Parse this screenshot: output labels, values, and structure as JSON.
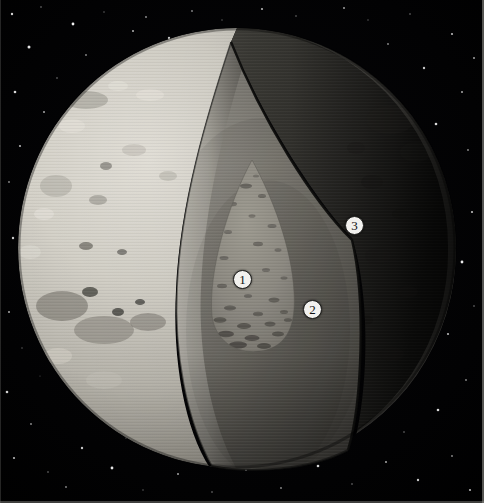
{
  "figure": {
    "background": "starfield",
    "width": 484,
    "height": 503
  },
  "colors": {
    "space": "#010103",
    "star": "#ffffff",
    "surface_light": "#d8d5cd",
    "surface_mid": "#b0ada4",
    "surface_dark": "#4a4843",
    "terminator_shadow": "#1d1c1a",
    "mantle_light": "#9d9a92",
    "mantle_mid": "#77746d",
    "mantle_dark": "#3e3c38",
    "core_fill": "#8d8a82",
    "core_speckle": "#3a3834",
    "core_base_arc": "#0b0b0a",
    "cut_wall_bright": "#c9c6bd",
    "callout_fill": "#f2f1ee",
    "callout_text": "#101010",
    "frame_line": "#9a9a96"
  },
  "callouts": [
    {
      "id": "1",
      "label": "1",
      "region": "core",
      "x": 242,
      "y": 279
    },
    {
      "id": "2",
      "label": "2",
      "region": "mantle",
      "x": 312,
      "y": 309
    },
    {
      "id": "3",
      "label": "3",
      "region": "crust",
      "x": 354,
      "y": 225
    }
  ],
  "geometry": {
    "globe": {
      "cx": 237,
      "cy": 248,
      "rx": 219,
      "ry": 220
    },
    "wedge_apex": {
      "x": 231,
      "y": 42
    },
    "core": {
      "cx": 253,
      "cy": 262,
      "rx": 44,
      "ry": 100
    }
  },
  "stars": [
    {
      "x": 12,
      "y": 14,
      "r": 1.2,
      "o": 0.82
    },
    {
      "x": 41,
      "y": 7,
      "r": 0.8,
      "o": 0.5
    },
    {
      "x": 73,
      "y": 24,
      "r": 1.4,
      "o": 0.95
    },
    {
      "x": 104,
      "y": 12,
      "r": 0.7,
      "o": 0.45
    },
    {
      "x": 133,
      "y": 31,
      "r": 1.0,
      "o": 0.7
    },
    {
      "x": 29,
      "y": 47,
      "r": 1.5,
      "o": 0.9
    },
    {
      "x": 86,
      "y": 55,
      "r": 0.9,
      "o": 0.55
    },
    {
      "x": 118,
      "y": 66,
      "r": 1.1,
      "o": 0.72
    },
    {
      "x": 57,
      "y": 78,
      "r": 0.8,
      "o": 0.5
    },
    {
      "x": 15,
      "y": 92,
      "r": 1.3,
      "o": 0.85
    },
    {
      "x": 97,
      "y": 88,
      "r": 0.7,
      "o": 0.42
    },
    {
      "x": 146,
      "y": 17,
      "r": 0.9,
      "o": 0.6
    },
    {
      "x": 169,
      "y": 38,
      "r": 1.2,
      "o": 0.78
    },
    {
      "x": 44,
      "y": 112,
      "r": 1.0,
      "o": 0.65
    },
    {
      "x": 78,
      "y": 128,
      "r": 0.8,
      "o": 0.48
    },
    {
      "x": 20,
      "y": 146,
      "r": 1.1,
      "o": 0.7
    },
    {
      "x": 9,
      "y": 182,
      "r": 0.9,
      "o": 0.55
    },
    {
      "x": 34,
      "y": 205,
      "r": 0.7,
      "o": 0.4
    },
    {
      "x": 13,
      "y": 238,
      "r": 1.2,
      "o": 0.8
    },
    {
      "x": 28,
      "y": 276,
      "r": 0.8,
      "o": 0.5
    },
    {
      "x": 9,
      "y": 312,
      "r": 1.0,
      "o": 0.66
    },
    {
      "x": 22,
      "y": 348,
      "r": 0.7,
      "o": 0.42
    },
    {
      "x": 7,
      "y": 392,
      "r": 1.3,
      "o": 0.82
    },
    {
      "x": 31,
      "y": 424,
      "r": 0.9,
      "o": 0.58
    },
    {
      "x": 14,
      "y": 458,
      "r": 1.1,
      "o": 0.72
    },
    {
      "x": 48,
      "y": 472,
      "r": 0.8,
      "o": 0.5
    },
    {
      "x": 82,
      "y": 448,
      "r": 1.2,
      "o": 0.78
    },
    {
      "x": 66,
      "y": 487,
      "r": 0.9,
      "o": 0.55
    },
    {
      "x": 112,
      "y": 468,
      "r": 1.4,
      "o": 0.9
    },
    {
      "x": 143,
      "y": 490,
      "r": 0.7,
      "o": 0.44
    },
    {
      "x": 178,
      "y": 474,
      "r": 1.0,
      "o": 0.64
    },
    {
      "x": 212,
      "y": 492,
      "r": 0.8,
      "o": 0.5
    },
    {
      "x": 246,
      "y": 470,
      "r": 1.1,
      "o": 0.7
    },
    {
      "x": 281,
      "y": 488,
      "r": 0.9,
      "o": 0.56
    },
    {
      "x": 318,
      "y": 466,
      "r": 1.3,
      "o": 0.84
    },
    {
      "x": 352,
      "y": 484,
      "r": 0.8,
      "o": 0.5
    },
    {
      "x": 386,
      "y": 462,
      "r": 1.0,
      "o": 0.66
    },
    {
      "x": 418,
      "y": 480,
      "r": 1.2,
      "o": 0.78
    },
    {
      "x": 452,
      "y": 456,
      "r": 0.9,
      "o": 0.56
    },
    {
      "x": 470,
      "y": 490,
      "r": 1.1,
      "o": 0.7
    },
    {
      "x": 404,
      "y": 432,
      "r": 0.8,
      "o": 0.48
    },
    {
      "x": 438,
      "y": 410,
      "r": 1.3,
      "o": 0.85
    },
    {
      "x": 466,
      "y": 380,
      "r": 0.9,
      "o": 0.55
    },
    {
      "x": 412,
      "y": 358,
      "r": 0.7,
      "o": 0.42
    },
    {
      "x": 448,
      "y": 334,
      "r": 1.1,
      "o": 0.72
    },
    {
      "x": 474,
      "y": 306,
      "r": 0.8,
      "o": 0.5
    },
    {
      "x": 420,
      "y": 288,
      "r": 1.0,
      "o": 0.64
    },
    {
      "x": 462,
      "y": 262,
      "r": 1.4,
      "o": 0.92
    },
    {
      "x": 433,
      "y": 236,
      "r": 0.9,
      "o": 0.58
    },
    {
      "x": 472,
      "y": 212,
      "r": 1.1,
      "o": 0.74
    },
    {
      "x": 446,
      "y": 188,
      "r": 0.8,
      "o": 0.48
    },
    {
      "x": 410,
      "y": 168,
      "r": 1.2,
      "o": 0.8
    },
    {
      "x": 468,
      "y": 150,
      "r": 0.9,
      "o": 0.56
    },
    {
      "x": 436,
      "y": 124,
      "r": 1.3,
      "o": 0.86
    },
    {
      "x": 398,
      "y": 104,
      "r": 0.8,
      "o": 0.5
    },
    {
      "x": 462,
      "y": 92,
      "r": 1.0,
      "o": 0.66
    },
    {
      "x": 424,
      "y": 68,
      "r": 1.2,
      "o": 0.78
    },
    {
      "x": 388,
      "y": 44,
      "r": 0.9,
      "o": 0.56
    },
    {
      "x": 452,
      "y": 34,
      "r": 1.1,
      "o": 0.72
    },
    {
      "x": 410,
      "y": 14,
      "r": 0.8,
      "o": 0.48
    },
    {
      "x": 474,
      "y": 58,
      "r": 1.0,
      "o": 0.64
    },
    {
      "x": 368,
      "y": 20,
      "r": 0.7,
      "o": 0.4
    },
    {
      "x": 344,
      "y": 8,
      "r": 1.0,
      "o": 0.62
    },
    {
      "x": 296,
      "y": 16,
      "r": 0.8,
      "o": 0.46
    },
    {
      "x": 262,
      "y": 9,
      "r": 1.1,
      "o": 0.7
    },
    {
      "x": 222,
      "y": 20,
      "r": 0.7,
      "o": 0.4
    },
    {
      "x": 192,
      "y": 11,
      "r": 0.9,
      "o": 0.54
    },
    {
      "x": 158,
      "y": 61,
      "r": 0.7,
      "o": 0.38
    },
    {
      "x": 62,
      "y": 162,
      "r": 0.6,
      "o": 0.34
    },
    {
      "x": 40,
      "y": 376,
      "r": 0.6,
      "o": 0.32
    },
    {
      "x": 126,
      "y": 438,
      "r": 0.7,
      "o": 0.4
    },
    {
      "x": 232,
      "y": 452,
      "r": 0.6,
      "o": 0.34
    },
    {
      "x": 340,
      "y": 444,
      "r": 0.7,
      "o": 0.4
    }
  ],
  "surface_features": [
    {
      "cx": 86,
      "cy": 100,
      "rx": 22,
      "ry": 9,
      "fill": "#9d9a91",
      "o": 0.55
    },
    {
      "cx": 72,
      "cy": 126,
      "rx": 13,
      "ry": 7,
      "fill": "#e9e6de",
      "o": 0.5
    },
    {
      "cx": 118,
      "cy": 86,
      "rx": 10,
      "ry": 5,
      "fill": "#eae7df",
      "o": 0.55
    },
    {
      "cx": 150,
      "cy": 95,
      "rx": 14,
      "ry": 6,
      "fill": "#edeae2",
      "o": 0.5
    },
    {
      "cx": 56,
      "cy": 186,
      "rx": 16,
      "ry": 11,
      "fill": "#a5a299",
      "o": 0.45
    },
    {
      "cx": 44,
      "cy": 214,
      "rx": 10,
      "ry": 6,
      "fill": "#eae7df",
      "o": 0.45
    },
    {
      "cx": 98,
      "cy": 200,
      "rx": 9,
      "ry": 5,
      "fill": "#88857d",
      "o": 0.5
    },
    {
      "cx": 30,
      "cy": 252,
      "rx": 11,
      "ry": 7,
      "fill": "#e4e1d9",
      "o": 0.4
    },
    {
      "cx": 86,
      "cy": 246,
      "rx": 7,
      "ry": 4,
      "fill": "#57554f",
      "o": 0.6
    },
    {
      "cx": 122,
      "cy": 252,
      "rx": 5,
      "ry": 3,
      "fill": "#4b4944",
      "o": 0.6
    },
    {
      "cx": 62,
      "cy": 306,
      "rx": 26,
      "ry": 15,
      "fill": "#6f6c65",
      "o": 0.55
    },
    {
      "cx": 104,
      "cy": 330,
      "rx": 30,
      "ry": 14,
      "fill": "#7b7870",
      "o": 0.5
    },
    {
      "cx": 148,
      "cy": 322,
      "rx": 18,
      "ry": 9,
      "fill": "#6a6760",
      "o": 0.45
    },
    {
      "cx": 90,
      "cy": 292,
      "rx": 8,
      "ry": 5,
      "fill": "#35342f",
      "o": 0.7
    },
    {
      "cx": 118,
      "cy": 312,
      "rx": 6,
      "ry": 4,
      "fill": "#2e2d29",
      "o": 0.7
    },
    {
      "cx": 140,
      "cy": 302,
      "rx": 5,
      "ry": 3,
      "fill": "#2a2926",
      "o": 0.65
    },
    {
      "cx": 58,
      "cy": 356,
      "rx": 14,
      "ry": 8,
      "fill": "#ded9d0",
      "o": 0.4
    },
    {
      "cx": 104,
      "cy": 380,
      "rx": 18,
      "ry": 9,
      "fill": "#c9c5bc",
      "o": 0.35
    },
    {
      "cx": 70,
      "cy": 412,
      "rx": 12,
      "ry": 6,
      "fill": "#b8b4ab",
      "o": 0.35
    },
    {
      "cx": 134,
      "cy": 150,
      "rx": 12,
      "ry": 6,
      "fill": "#b3b0a7",
      "o": 0.4
    },
    {
      "cx": 168,
      "cy": 176,
      "rx": 9,
      "ry": 5,
      "fill": "#a8a59c",
      "o": 0.4
    },
    {
      "cx": 106,
      "cy": 166,
      "rx": 6,
      "ry": 4,
      "fill": "#56544e",
      "o": 0.5
    }
  ],
  "crust_features": [
    {
      "cx": 390,
      "cy": 120,
      "rx": 24,
      "ry": 14,
      "fill": "#2b2a27",
      "o": 0.55
    },
    {
      "cx": 416,
      "cy": 152,
      "rx": 16,
      "ry": 10,
      "fill": "#262522",
      "o": 0.5
    },
    {
      "cx": 372,
      "cy": 182,
      "rx": 11,
      "ry": 7,
      "fill": "#1f1e1c",
      "o": 0.6
    },
    {
      "cx": 400,
      "cy": 214,
      "rx": 8,
      "ry": 5,
      "fill": "#1b1a18",
      "o": 0.6
    },
    {
      "cx": 378,
      "cy": 256,
      "rx": 13,
      "ry": 8,
      "fill": "#201f1d",
      "o": 0.55
    },
    {
      "cx": 408,
      "cy": 292,
      "rx": 10,
      "ry": 6,
      "fill": "#1d1c1a",
      "o": 0.5
    },
    {
      "cx": 366,
      "cy": 320,
      "rx": 7,
      "ry": 5,
      "fill": "#191816",
      "o": 0.55
    },
    {
      "cx": 392,
      "cy": 354,
      "rx": 12,
      "ry": 7,
      "fill": "#1c1b19",
      "o": 0.45
    },
    {
      "cx": 356,
      "cy": 148,
      "rx": 9,
      "ry": 6,
      "fill": "#232220",
      "o": 0.5
    },
    {
      "cx": 348,
      "cy": 290,
      "rx": 6,
      "ry": 4,
      "fill": "#171614",
      "o": 0.5
    }
  ],
  "core_speckles": [
    {
      "cx": 246,
      "cy": 186,
      "rx": 6,
      "ry": 2.4,
      "o": 0.5
    },
    {
      "cx": 262,
      "cy": 196,
      "rx": 4,
      "ry": 2.0,
      "o": 0.45
    },
    {
      "cx": 232,
      "cy": 204,
      "rx": 5,
      "ry": 2.2,
      "o": 0.42
    },
    {
      "cx": 252,
      "cy": 216,
      "rx": 3.5,
      "ry": 1.8,
      "o": 0.38
    },
    {
      "cx": 272,
      "cy": 226,
      "rx": 4.5,
      "ry": 2.0,
      "o": 0.42
    },
    {
      "cx": 228,
      "cy": 232,
      "rx": 4,
      "ry": 2.0,
      "o": 0.4
    },
    {
      "cx": 258,
      "cy": 244,
      "rx": 5,
      "ry": 2.2,
      "o": 0.45
    },
    {
      "cx": 278,
      "cy": 250,
      "rx": 3.5,
      "ry": 1.8,
      "o": 0.4
    },
    {
      "cx": 224,
      "cy": 258,
      "rx": 4.5,
      "ry": 2.0,
      "o": 0.42
    },
    {
      "cx": 266,
      "cy": 270,
      "rx": 4,
      "ry": 2.0,
      "o": 0.4
    },
    {
      "cx": 284,
      "cy": 278,
      "rx": 3.5,
      "ry": 1.8,
      "o": 0.38
    },
    {
      "cx": 222,
      "cy": 286,
      "rx": 5,
      "ry": 2.2,
      "o": 0.45
    },
    {
      "cx": 248,
      "cy": 296,
      "rx": 4,
      "ry": 2.0,
      "o": 0.42
    },
    {
      "cx": 274,
      "cy": 300,
      "rx": 5.5,
      "ry": 2.4,
      "o": 0.5
    },
    {
      "cx": 230,
      "cy": 308,
      "rx": 6,
      "ry": 2.6,
      "o": 0.52
    },
    {
      "cx": 258,
      "cy": 314,
      "rx": 5,
      "ry": 2.2,
      "o": 0.5
    },
    {
      "cx": 284,
      "cy": 312,
      "rx": 4,
      "ry": 2.0,
      "o": 0.45
    },
    {
      "cx": 220,
      "cy": 320,
      "rx": 6.5,
      "ry": 2.8,
      "o": 0.58
    },
    {
      "cx": 244,
      "cy": 326,
      "rx": 7,
      "ry": 3.0,
      "o": 0.6
    },
    {
      "cx": 270,
      "cy": 324,
      "rx": 5.5,
      "ry": 2.4,
      "o": 0.55
    },
    {
      "cx": 288,
      "cy": 320,
      "rx": 4,
      "ry": 2.0,
      "o": 0.48
    },
    {
      "cx": 226,
      "cy": 334,
      "rx": 8,
      "ry": 3.2,
      "o": 0.65
    },
    {
      "cx": 252,
      "cy": 338,
      "rx": 7.5,
      "ry": 3.0,
      "o": 0.65
    },
    {
      "cx": 278,
      "cy": 334,
      "rx": 6,
      "ry": 2.6,
      "o": 0.58
    },
    {
      "cx": 238,
      "cy": 345,
      "rx": 9,
      "ry": 3.4,
      "o": 0.7
    },
    {
      "cx": 264,
      "cy": 346,
      "rx": 7,
      "ry": 3.0,
      "o": 0.66
    },
    {
      "cx": 240,
      "cy": 168,
      "rx": 4,
      "ry": 2.0,
      "o": 0.35
    },
    {
      "cx": 256,
      "cy": 176,
      "rx": 3,
      "ry": 1.6,
      "o": 0.32
    }
  ]
}
